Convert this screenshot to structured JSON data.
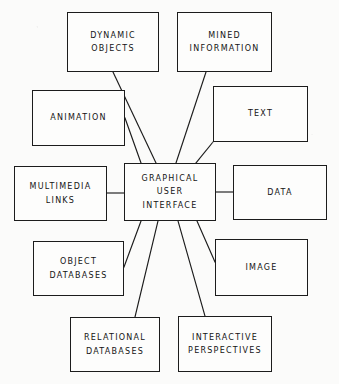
{
  "diagram": {
    "type": "hub-and-spoke concept map",
    "background_color": "#fbfbfa",
    "line_color": "#1c1c1c",
    "text_color": "#141414",
    "center": {
      "id": "graphical-user-interface",
      "lines": [
        "GRAPHICAL",
        "USER",
        "INTERFACE"
      ],
      "x": 124,
      "y": 163,
      "w": 92,
      "h": 58
    },
    "nodes": [
      {
        "id": "dynamic-objects",
        "lines": [
          "DYNAMIC",
          "OBJECTS"
        ],
        "x": 67,
        "y": 12,
        "w": 92,
        "h": 60
      },
      {
        "id": "mined-information",
        "lines": [
          "MINED",
          "INFORMATION"
        ],
        "x": 177,
        "y": 12,
        "w": 95,
        "h": 60
      },
      {
        "id": "animation",
        "lines": [
          "ANIMATION"
        ],
        "x": 32,
        "y": 90,
        "w": 93,
        "h": 56
      },
      {
        "id": "text",
        "lines": [
          "TEXT"
        ],
        "x": 213,
        "y": 86,
        "w": 95,
        "h": 56
      },
      {
        "id": "multimedia-links",
        "lines": [
          "MULTIMEDIA",
          "LINKS"
        ],
        "x": 14,
        "y": 166,
        "w": 93,
        "h": 55
      },
      {
        "id": "data",
        "lines": [
          "DATA"
        ],
        "x": 233,
        "y": 165,
        "w": 94,
        "h": 55
      },
      {
        "id": "object-databases",
        "lines": [
          "OBJECT",
          "DATABASES"
        ],
        "x": 33,
        "y": 241,
        "w": 91,
        "h": 55
      },
      {
        "id": "image",
        "lines": [
          "IMAGE"
        ],
        "x": 215,
        "y": 239,
        "w": 93,
        "h": 57
      },
      {
        "id": "relational-databases",
        "lines": [
          "RELATIONAL",
          "DATABASES"
        ],
        "x": 70,
        "y": 317,
        "w": 90,
        "h": 55
      },
      {
        "id": "interactive-perspectives",
        "lines": [
          "INTERACTIVE",
          "PERSPECTIVES"
        ],
        "x": 178,
        "y": 316,
        "w": 94,
        "h": 56
      }
    ],
    "connectors": [
      {
        "from": "dynamic-objects",
        "to": "graphical-user-interface",
        "x1": 113,
        "y1": 72,
        "x2": 156,
        "y2": 163
      },
      {
        "from": "mined-information",
        "to": "graphical-user-interface",
        "x1": 206,
        "y1": 72,
        "x2": 176,
        "y2": 163
      },
      {
        "from": "animation",
        "to": "graphical-user-interface",
        "x1": 125,
        "y1": 118,
        "x2": 141,
        "y2": 163
      },
      {
        "from": "text",
        "to": "graphical-user-interface",
        "x1": 213,
        "y1": 142,
        "x2": 196,
        "y2": 163
      },
      {
        "from": "multimedia-links",
        "to": "graphical-user-interface",
        "x1": 107,
        "y1": 193,
        "x2": 124,
        "y2": 193
      },
      {
        "from": "data",
        "to": "graphical-user-interface",
        "x1": 216,
        "y1": 192,
        "x2": 233,
        "y2": 192
      },
      {
        "from": "object-databases",
        "to": "graphical-user-interface",
        "x1": 124,
        "y1": 267,
        "x2": 141,
        "y2": 221
      },
      {
        "from": "image",
        "to": "graphical-user-interface",
        "x1": 215,
        "y1": 262,
        "x2": 197,
        "y2": 221
      },
      {
        "from": "relational-databases",
        "to": "graphical-user-interface",
        "x1": 135,
        "y1": 317,
        "x2": 158,
        "y2": 221
      },
      {
        "from": "interactive-perspectives",
        "to": "graphical-user-interface",
        "x1": 205,
        "y1": 316,
        "x2": 178,
        "y2": 221
      }
    ]
  }
}
